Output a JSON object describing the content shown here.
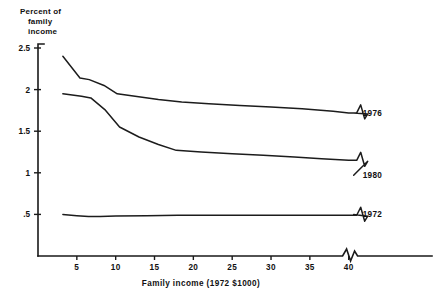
{
  "chart_data": {
    "type": "line",
    "title_lines": [
      "Percent of",
      "family",
      "income"
    ],
    "xlabel": "Family income (1972 $1000)",
    "ylabel": "Percent of family income",
    "xlim": [
      0,
      43
    ],
    "ylim": [
      0,
      2.5
    ],
    "xticks": [
      5,
      10,
      15,
      20,
      25,
      30,
      35,
      40
    ],
    "xtick_labels": [
      "5",
      "10",
      "15",
      "20",
      "25",
      "30",
      "35",
      "40"
    ],
    "yticks": [
      0.5,
      1,
      1.5,
      2,
      2.5
    ],
    "ytick_labels": [
      ".5",
      "1",
      "1.5",
      "2",
      "2.5"
    ],
    "grid": false,
    "legend_position": "right-inline-labels",
    "axis_break": true,
    "axis_break_x": 40.5,
    "series": [
      {
        "name": "1976",
        "label": "1976",
        "label_x": 41.8,
        "label_y": 1.72,
        "x": [
          3.2,
          5.4,
          6.6,
          8.5,
          10.2,
          12.5,
          15.5,
          18.5,
          22.0,
          26.0,
          30.0,
          34.0,
          38.0,
          40.0
        ],
        "values": [
          2.4,
          2.14,
          2.12,
          2.05,
          1.95,
          1.92,
          1.88,
          1.85,
          1.83,
          1.81,
          1.79,
          1.77,
          1.74,
          1.72
        ]
      },
      {
        "name": "1980",
        "label": "1980",
        "label_x": 41.8,
        "label_y": 0.97,
        "x": [
          3.2,
          5.6,
          6.8,
          8.6,
          10.5,
          13.0,
          15.5,
          17.8,
          21.0,
          25.0,
          29.0,
          33.0,
          36.5,
          40.0
        ],
        "values": [
          1.95,
          1.92,
          1.9,
          1.76,
          1.55,
          1.43,
          1.34,
          1.27,
          1.25,
          1.23,
          1.21,
          1.19,
          1.17,
          1.15
        ]
      },
      {
        "name": "1972",
        "label": "1972",
        "label_x": 41.8,
        "label_y": 0.5,
        "x": [
          3.2,
          5.0,
          6.5,
          8.0,
          10.0,
          14.0,
          18.0,
          23.0,
          28.0,
          33.0,
          37.0,
          40.0
        ],
        "values": [
          0.5,
          0.485,
          0.475,
          0.475,
          0.48,
          0.485,
          0.49,
          0.49,
          0.49,
          0.49,
          0.49,
          0.49
        ]
      }
    ]
  }
}
